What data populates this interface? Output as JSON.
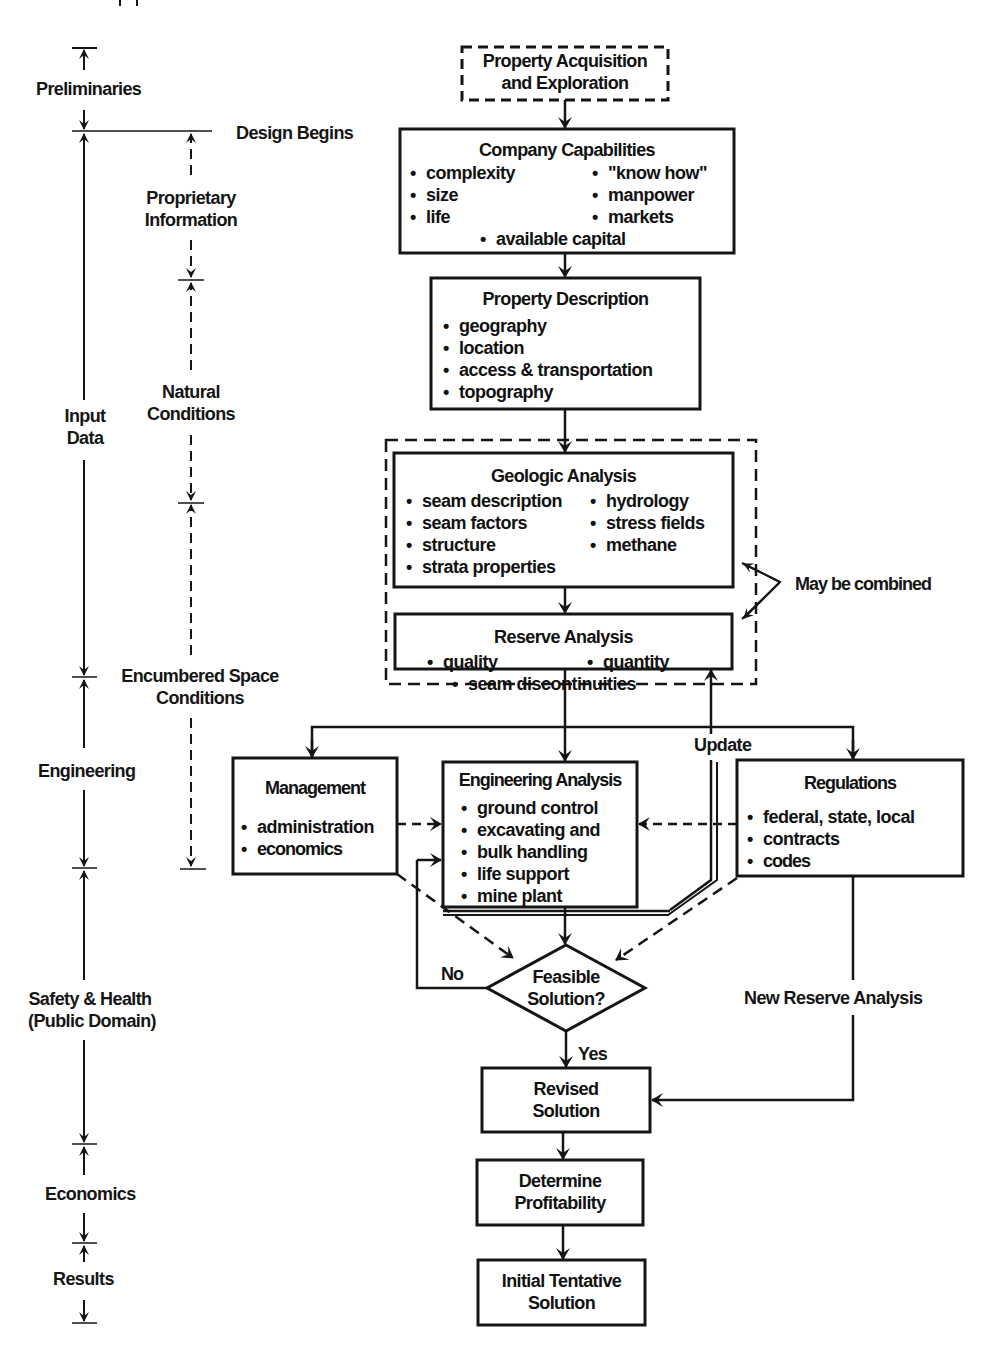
{
  "header_fragment": "...pp...",
  "timeline": {
    "left_phases": [
      {
        "id": "preliminaries",
        "label": "Preliminaries"
      },
      {
        "id": "input-data",
        "label_line1": "Input",
        "label_line2": "Data"
      },
      {
        "id": "engineering",
        "label": "Engineering"
      },
      {
        "id": "safety-health",
        "label_line1": "Safety & Health",
        "label_line2": "(Public Domain)"
      },
      {
        "id": "economics",
        "label": "Economics"
      },
      {
        "id": "results",
        "label": "Results"
      }
    ],
    "design_begins": "Design Begins",
    "sub_phases": [
      {
        "id": "proprietary",
        "label_line1": "Proprietary",
        "label_line2": "Information"
      },
      {
        "id": "natural",
        "label_line1": "Natural",
        "label_line2": "Conditions"
      },
      {
        "id": "encumbered",
        "label_line1": "Encumbered Space",
        "label_line2": "Conditions"
      }
    ]
  },
  "flow": {
    "property_acquisition": {
      "line1": "Property Acquisition",
      "line2": "and Exploration",
      "style": "dashed"
    },
    "company_capabilities": {
      "title": "Company Capabilities",
      "left_items": [
        "complexity",
        "size",
        "life"
      ],
      "right_items": [
        "\"know how\"",
        "manpower",
        "markets"
      ],
      "center_item": "available capital"
    },
    "property_description": {
      "title": "Property Description",
      "items": [
        "geography",
        "location",
        "access & transportation",
        "topography"
      ]
    },
    "geologic_analysis": {
      "title": "Geologic Analysis",
      "left_items": [
        "seam description",
        "seam factors",
        "structure",
        "strata properties"
      ],
      "right_items": [
        "hydrology",
        "stress fields",
        "methane"
      ]
    },
    "reserve_analysis": {
      "title": "Reserve Analysis",
      "left_item": "quality",
      "right_item": "quantity",
      "center_item": "seam discontinuities"
    },
    "may_be_combined": "May be combined",
    "update_label": "Update",
    "management": {
      "title": "Management",
      "items": [
        "administration",
        "economics"
      ]
    },
    "engineering_analysis": {
      "title": "Engineering Analysis",
      "items": [
        "ground control",
        "excavating and",
        "bulk handling",
        "life support",
        "mine plant"
      ]
    },
    "regulations": {
      "title": "Regulations",
      "items": [
        "federal, state, local",
        "contracts",
        "codes"
      ]
    },
    "decision": {
      "line1": "Feasible",
      "line2": "Solution?",
      "no_label": "No",
      "yes_label": "Yes"
    },
    "new_reserve_analysis": "New Reserve Analysis",
    "revised_solution": {
      "line1": "Revised",
      "line2": "Solution"
    },
    "determine_profitability": {
      "line1": "Determine",
      "line2": "Profitability"
    },
    "initial_tentative_solution": {
      "line1": "Initial Tentative",
      "line2": "Solution"
    }
  },
  "colors": {
    "ink": "#151515",
    "background": "#ffffff"
  }
}
